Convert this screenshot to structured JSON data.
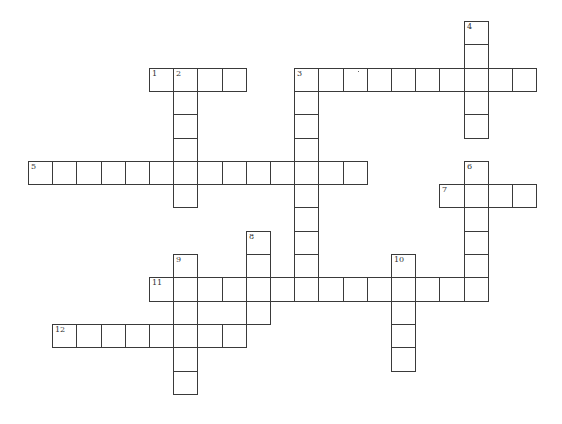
{
  "puzzle": {
    "type": "crossword",
    "grid": {
      "origin_x": 28,
      "origin_y": 21,
      "cell_w": 24.2,
      "cell_h": 23.3
    },
    "line_color": "#3a3a3a",
    "entries": [
      {
        "number": "1",
        "direction": "across",
        "row": 2,
        "col": 5,
        "length": 4
      },
      {
        "number": "2",
        "direction": "down",
        "row": 2,
        "col": 6,
        "length": 6
      },
      {
        "number": "3",
        "direction": "across",
        "row": 2,
        "col": 11,
        "length": 10
      },
      {
        "number": "3",
        "direction": "down",
        "row": 2,
        "col": 11,
        "length": 10
      },
      {
        "number": "4",
        "direction": "down",
        "row": 0,
        "col": 18,
        "length": 5
      },
      {
        "number": "5",
        "direction": "across",
        "row": 6,
        "col": 0,
        "length": 14
      },
      {
        "number": "6",
        "direction": "down",
        "row": 6,
        "col": 18,
        "length": 6
      },
      {
        "number": "7",
        "direction": "across",
        "row": 7,
        "col": 17,
        "length": 4
      },
      {
        "number": "8",
        "direction": "down",
        "row": 9,
        "col": 9,
        "length": 4
      },
      {
        "number": "9",
        "direction": "down",
        "row": 10,
        "col": 6,
        "length": 6
      },
      {
        "number": "10",
        "direction": "down",
        "row": 10,
        "col": 15,
        "length": 5
      },
      {
        "number": "11",
        "direction": "across",
        "row": 11,
        "col": 5,
        "length": 14
      },
      {
        "number": "12",
        "direction": "across",
        "row": 13,
        "col": 1,
        "length": 8
      }
    ]
  }
}
